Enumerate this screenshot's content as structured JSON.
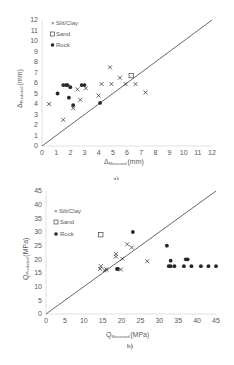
{
  "chart_data": [
    {
      "type": "scatter",
      "caption": "a)",
      "xlabel": "Δ Measured (mm)",
      "ylabel": "Δ Predicted (mm)",
      "xlim": [
        0,
        12
      ],
      "ylim": [
        0,
        12
      ],
      "xticks": [
        0,
        1,
        2,
        3,
        4,
        5,
        6,
        7,
        8,
        9,
        10,
        11,
        12
      ],
      "yticks": [
        0,
        1,
        2,
        3,
        4,
        5,
        6,
        7,
        8,
        9,
        10,
        11,
        12
      ],
      "grid": false,
      "reference_line": "1:1",
      "legend": [
        "Silt/Clay",
        "Sand",
        "Rock"
      ],
      "legend_position": "upper left",
      "series": [
        {
          "name": "Silt/Clay",
          "marker": "x",
          "points": [
            [
              0.5,
              4.0
            ],
            [
              1.5,
              2.5
            ],
            [
              2.2,
              3.6
            ],
            [
              2.5,
              5.4
            ],
            [
              2.7,
              4.4
            ],
            [
              3.1,
              5.5
            ],
            [
              4.0,
              4.8
            ],
            [
              4.2,
              5.9
            ],
            [
              4.8,
              7.5
            ],
            [
              4.9,
              5.9
            ],
            [
              5.5,
              6.5
            ],
            [
              5.9,
              5.9
            ],
            [
              6.6,
              5.9
            ],
            [
              7.3,
              5.1
            ]
          ]
        },
        {
          "name": "Sand",
          "marker": "square-open",
          "points": [
            [
              6.3,
              6.7
            ]
          ]
        },
        {
          "name": "Rock",
          "marker": "circle-filled",
          "points": [
            [
              1.1,
              5.0
            ],
            [
              1.5,
              5.8
            ],
            [
              1.7,
              5.8
            ],
            [
              1.8,
              5.8
            ],
            [
              2.0,
              5.6
            ],
            [
              1.9,
              4.6
            ],
            [
              2.2,
              3.9
            ],
            [
              2.8,
              5.8
            ],
            [
              3.0,
              5.8
            ],
            [
              4.1,
              4.1
            ]
          ]
        }
      ]
    },
    {
      "type": "scatter",
      "caption": "b)",
      "xlabel": "Q Measured (MPa)",
      "ylabel": "Q Predicted (MPa)",
      "xlim": [
        0,
        45
      ],
      "ylim": [
        0,
        45
      ],
      "xticks": [
        0,
        5,
        10,
        15,
        20,
        25,
        30,
        35,
        40,
        45
      ],
      "yticks": [
        0,
        5,
        10,
        15,
        20,
        25,
        30,
        35,
        40,
        45
      ],
      "grid": false,
      "reference_line": "1:1",
      "legend": [
        "Silt/Clay",
        "Sand",
        "Rock"
      ],
      "legend_position": "upper left",
      "series": [
        {
          "name": "Silt/Clay",
          "marker": "x",
          "points": [
            [
              14.3,
              16.5
            ],
            [
              14.5,
              17.5
            ],
            [
              15.5,
              16.0
            ],
            [
              16.0,
              16.3
            ],
            [
              18.5,
              22.0
            ],
            [
              18.5,
              21.0
            ],
            [
              19.8,
              16.3
            ],
            [
              20.2,
              20.2
            ],
            [
              21.5,
              25.5
            ],
            [
              22.7,
              24.3
            ],
            [
              26.8,
              19.3
            ]
          ]
        },
        {
          "name": "Sand",
          "marker": "square-open",
          "points": [
            [
              14.5,
              29.0
            ]
          ]
        },
        {
          "name": "Rock",
          "marker": "circle-filled",
          "points": [
            [
              18.8,
              16.5
            ],
            [
              19.0,
              16.5
            ],
            [
              23.0,
              30.0
            ],
            [
              32.0,
              25.0
            ],
            [
              33.0,
              19.5
            ],
            [
              37.0,
              20.0
            ],
            [
              37.5,
              20.0
            ],
            [
              32.5,
              17.5
            ],
            [
              33.0,
              17.5
            ],
            [
              34.0,
              17.5
            ],
            [
              36.5,
              17.5
            ],
            [
              38.5,
              17.5
            ],
            [
              41.0,
              17.5
            ],
            [
              43.0,
              17.5
            ],
            [
              45.0,
              17.5
            ]
          ]
        }
      ]
    }
  ],
  "charts": {
    "a": {
      "caption": "a)",
      "xlabel_main": "Δ",
      "xlabel_sub": "Measured",
      "xlabel_unit": "(mm)",
      "ylabel_main": "Δ",
      "ylabel_sub": "Predicted",
      "ylabel_unit": "(mm)"
    },
    "b": {
      "caption": "b)",
      "xlabel_main": "Q",
      "xlabel_sub": "Measured",
      "xlabel_unit": "(MPa)",
      "ylabel_main": "Q",
      "ylabel_sub": "Predicted",
      "ylabel_unit": "(MPa)"
    }
  },
  "legend": {
    "silt": "Silt/Clay",
    "sand": "Sand",
    "rock": "Rock"
  },
  "colors": {
    "axis": "#d9d9d9",
    "marker": "#262626",
    "line": "#404040",
    "text": "#595959"
  }
}
